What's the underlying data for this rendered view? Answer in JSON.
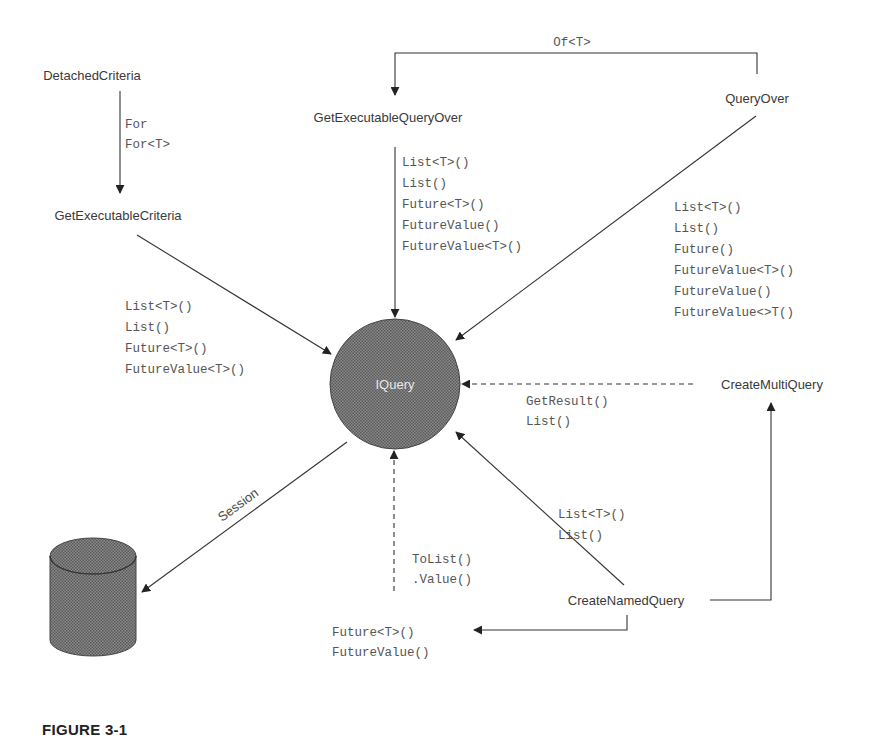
{
  "figure": {
    "caption": "FIGURE 3-1"
  },
  "colors": {
    "line": "#333333",
    "node_text": "#3a3a3a",
    "code_text": "#555555",
    "shape_fill": "#7a7a7a",
    "center_text": "#e8e8e8"
  },
  "nodes": {
    "detached_criteria": "DetachedCriteria",
    "get_executable_criteria": "GetExecutableCriteria",
    "get_executable_query_over": "GetExecutableQueryOver",
    "query_over": "QueryOver",
    "iquery": "IQuery",
    "create_multi_query": "CreateMultiQuery",
    "create_named_query": "CreateNamedQuery",
    "database": "database-cylinder"
  },
  "edges": {
    "detached_to_executable": {
      "labels": [
        "For",
        "For<T>"
      ]
    },
    "queryover_to_executable_queryover": {
      "labels": [
        "Of<T>"
      ]
    },
    "executable_criteria_to_iquery": {
      "labels": [
        "List<T>()",
        "List()",
        "Future<T>()",
        "FutureValue<T>()"
      ]
    },
    "executable_queryover_to_iquery": {
      "labels": [
        "List<T>()",
        "List()",
        "Future<T>()",
        "FutureValue()",
        "FutureValue<T>()"
      ]
    },
    "queryover_to_iquery": {
      "labels": [
        "List<T>()",
        "List()",
        "Future()",
        "FutureValue<T>()",
        "FutureValue()",
        "FutureValue<>T()"
      ]
    },
    "multiquery_to_iquery": {
      "labels": [
        "GetResult()",
        "List()"
      ]
    },
    "namedquery_to_iquery": {
      "labels": [
        "List<T>()",
        "List()"
      ]
    },
    "future_to_iquery": {
      "labels": [
        "ToList()",
        ".Value()"
      ]
    },
    "namedquery_to_future": {
      "labels": [
        "Future<T>()",
        "FutureValue()"
      ]
    },
    "iquery_to_database": {
      "labels": [
        "Session"
      ]
    }
  }
}
